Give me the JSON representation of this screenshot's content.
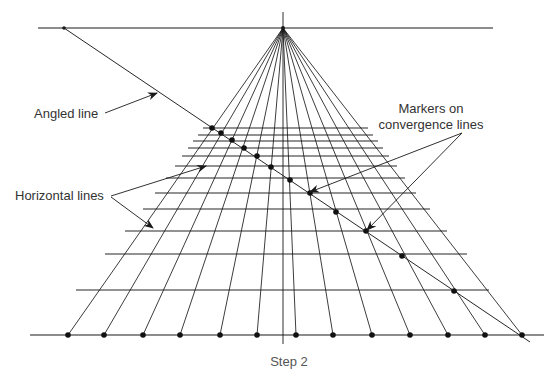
{
  "figure": {
    "caption": "Step 2",
    "labels": {
      "angled_line": "Angled line",
      "horizontal_lines": "Horizontal lines",
      "markers_line1": "Markers on",
      "markers_line2": "convergence lines"
    },
    "colors": {
      "line": "#1a1a1a",
      "text": "#333333",
      "caption": "#555555"
    },
    "vanishing_point": [
      283,
      28
    ],
    "horizon": {
      "y": 28,
      "x1": 38,
      "x2": 493
    },
    "vertical_center_line": {
      "x": 283,
      "y1": 12,
      "y2": 344
    },
    "base_line": {
      "y": 335,
      "x1": 30,
      "x2": 544
    },
    "base_points_x": [
      68,
      104,
      143,
      180,
      220,
      257,
      296,
      333,
      372,
      410,
      448,
      485,
      522
    ],
    "angled_line": {
      "x1": 64,
      "y1": 28,
      "x2": 530,
      "y2": 342
    },
    "horizontal_lines": [
      {
        "y": 128,
        "x1": 203,
        "x2": 368
      },
      {
        "y": 135,
        "x1": 198,
        "x2": 373
      },
      {
        "y": 141,
        "x1": 193,
        "x2": 378
      },
      {
        "y": 148,
        "x1": 188,
        "x2": 383
      },
      {
        "y": 156,
        "x1": 182,
        "x2": 389
      },
      {
        "y": 166,
        "x1": 175,
        "x2": 397
      },
      {
        "y": 178,
        "x1": 166,
        "x2": 405
      },
      {
        "y": 193,
        "x1": 155,
        "x2": 416
      },
      {
        "y": 209,
        "x1": 143,
        "x2": 430
      },
      {
        "y": 231,
        "x1": 125,
        "x2": 447
      },
      {
        "y": 254,
        "x1": 105,
        "x2": 467
      },
      {
        "y": 290,
        "x1": 76,
        "x2": 489
      }
    ],
    "markers": [
      [
        212,
        128
      ],
      [
        221,
        133
      ],
      [
        232,
        140
      ],
      [
        244,
        148
      ],
      [
        257,
        156
      ],
      [
        271,
        167
      ],
      [
        290,
        180
      ],
      [
        310,
        193
      ],
      [
        336,
        212
      ],
      [
        366,
        231
      ],
      [
        402,
        256
      ],
      [
        454,
        291
      ]
    ]
  }
}
